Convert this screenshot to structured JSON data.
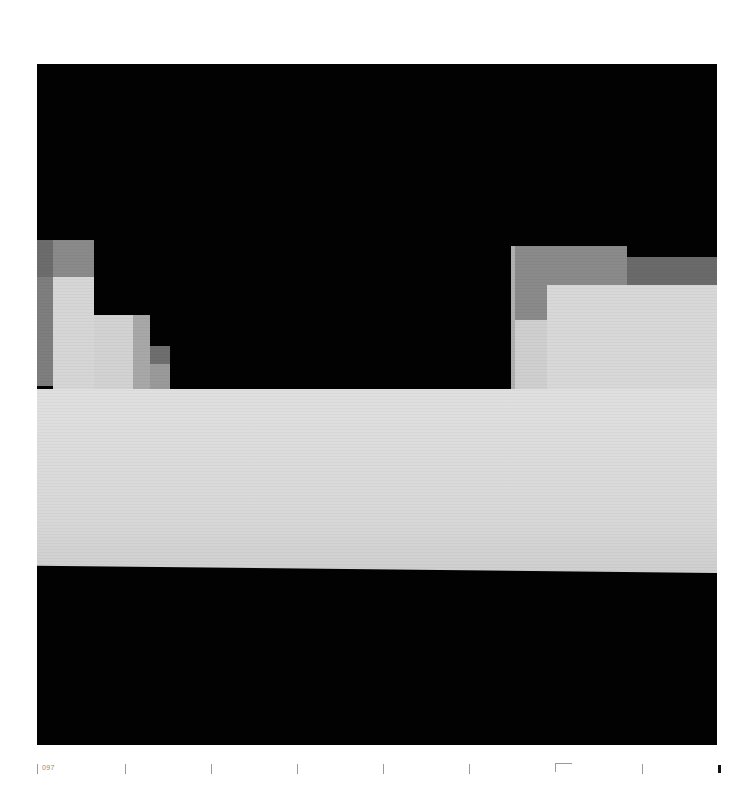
{
  "page": {
    "number": "097",
    "background": "#ffffff"
  },
  "plate": {
    "description": "Photographic plate of a blocky, pixelated monochrome screen image",
    "colors": {
      "black": "#020202",
      "dark_gray": "#555555",
      "mid_gray": "#7a7a7a",
      "light_gray": "#c8c8c8",
      "bright": "#dcdcdc"
    }
  },
  "footer": {
    "page_number": "097",
    "tick_positions_px": [
      37,
      125,
      211,
      297,
      383,
      469,
      642
    ],
    "corner_mark": true,
    "end_mark": true
  }
}
